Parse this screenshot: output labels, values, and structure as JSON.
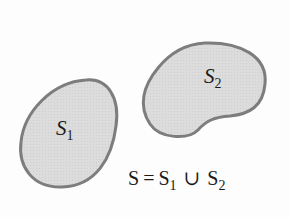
{
  "diagram": {
    "regions": [
      {
        "id": "S1",
        "label_main": "S",
        "label_sub": "1",
        "fill": "#d9d9d9",
        "stroke": "#808080"
      },
      {
        "id": "S2",
        "label_main": "S",
        "label_sub": "2",
        "fill": "#d9d9d9",
        "stroke": "#808080"
      }
    ],
    "equation": {
      "lhs": "S",
      "equals": "=",
      "term1_main": "S",
      "term1_sub": "1",
      "operator": "∪",
      "term2_main": "S",
      "term2_sub": "2"
    }
  }
}
